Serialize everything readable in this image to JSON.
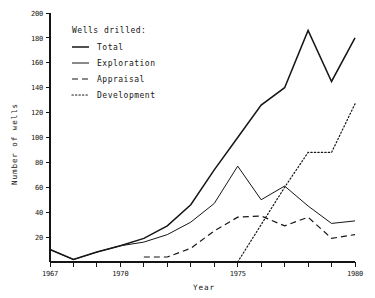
{
  "chart_data": {
    "type": "line",
    "title": "",
    "xlabel": "Year",
    "ylabel": "Number of wells",
    "xlim": [
      1967,
      1980
    ],
    "ylim": [
      0,
      200
    ],
    "grid": false,
    "legend_position": "top-left",
    "legend_title": "Wells drilled:",
    "x": [
      1967,
      1968,
      1969,
      1970,
      1971,
      1972,
      1973,
      1974,
      1975,
      1976,
      1977,
      1978,
      1979,
      1980
    ],
    "xticks": [
      1967,
      1968,
      1969,
      1970,
      1971,
      1972,
      1973,
      1974,
      1975,
      1976,
      1977,
      1978,
      1979,
      1980
    ],
    "xticklabels": [
      "1967",
      "",
      "",
      "1970",
      "",
      "",
      "",
      "",
      "1975",
      "",
      "",
      "",
      "",
      "1980"
    ],
    "yticks": [
      0,
      20,
      40,
      60,
      80,
      100,
      120,
      140,
      160,
      180,
      200
    ],
    "yticklabels": [
      "",
      "20",
      "40",
      "60",
      "80",
      "100",
      "120",
      "140",
      "160",
      "180",
      "200"
    ],
    "series": [
      {
        "name": "Total",
        "style": "solid",
        "linewidth": "thick",
        "x": [
          1967,
          1968,
          1969,
          1970,
          1971,
          1972,
          1973,
          1974,
          1975,
          1976,
          1977,
          1978,
          1979,
          1980
        ],
        "values": [
          10,
          2,
          8,
          13,
          19,
          29,
          46,
          74,
          100,
          126,
          140,
          186,
          145,
          180
        ]
      },
      {
        "name": "Exploration",
        "style": "solid",
        "linewidth": "thin",
        "x": [
          1967,
          1968,
          1969,
          1970,
          1971,
          1972,
          1973,
          1974,
          1975,
          1976,
          1977,
          1978,
          1979,
          1980
        ],
        "values": [
          10,
          2,
          8,
          13,
          16,
          22,
          32,
          47,
          77,
          50,
          61,
          45,
          31,
          33
        ]
      },
      {
        "name": "Appraisal",
        "style": "dashed",
        "linewidth": "thin",
        "x": [
          1971,
          1972,
          1973,
          1974,
          1975,
          1976,
          1977,
          1978,
          1979,
          1980
        ],
        "values": [
          4,
          4,
          11,
          25,
          36,
          37,
          29,
          36,
          19,
          22
        ]
      },
      {
        "name": "Development",
        "style": "dotted",
        "linewidth": "thin",
        "x": [
          1975,
          1976,
          1977,
          1978,
          1979,
          1980
        ],
        "values": [
          0,
          30,
          60,
          88,
          88,
          127
        ]
      }
    ]
  },
  "legend": {
    "title": "Wells drilled:",
    "items": [
      {
        "label": "Total",
        "style": "solid-thick"
      },
      {
        "label": "Exploration",
        "style": "solid-thin"
      },
      {
        "label": "Appraisal",
        "style": "dashed"
      },
      {
        "label": "Development",
        "style": "dotted"
      }
    ]
  },
  "axes": {
    "y_title": "Number of wells",
    "x_title": "Year",
    "y_labels": [
      "200",
      "180",
      "160",
      "140",
      "120",
      "100",
      "80",
      "60",
      "40",
      "20"
    ],
    "x_labels": [
      "1967",
      "1970",
      "1975",
      "1980"
    ]
  }
}
